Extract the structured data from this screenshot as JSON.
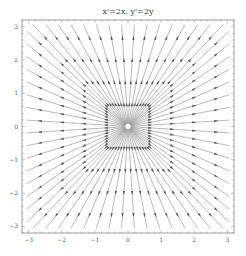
{
  "chart_data": {
    "type": "streamplot",
    "title": "x'=2x, y'=2y",
    "xlabel": "",
    "ylabel": "",
    "xlim": [
      -3.2,
      3.2
    ],
    "ylim": [
      -3.2,
      3.2
    ],
    "xticks": [
      -3,
      -2,
      -1,
      0,
      1,
      2,
      3
    ],
    "yticks": [
      -3,
      -2,
      -1,
      0,
      1,
      2,
      3
    ],
    "grid": false,
    "field": {
      "dx": "2x",
      "dy": "2y"
    },
    "rays_per_side": 16,
    "arrowheads_per_ray": 4,
    "line_color": "#8c8c8c",
    "arrow_color": "#555555"
  },
  "frame": {
    "left": 22,
    "top": 20,
    "right": 234,
    "bottom": 233
  }
}
